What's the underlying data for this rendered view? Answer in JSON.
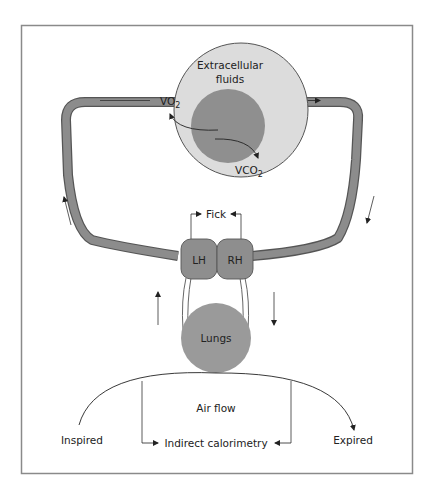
{
  "colors": {
    "frame": "#8a8a8a",
    "vessel_fill": "#8c8c8c",
    "vessel_edge": "#555555",
    "ecf_fill": "#dcdcdc",
    "cell_fill": "#8f8f8f",
    "heart_fill": "#8e8e8e",
    "lungs_fill": "#9a9a9a",
    "line": "#333333"
  },
  "labels": {
    "extracellular_line1": "Extracellular",
    "extracellular_line2": "fluids",
    "vo2_main": "VO",
    "vo2_sub": "2",
    "vco2_main": "VCO",
    "vco2_sub": "2",
    "fick": "Fick",
    "left_heart": "LH",
    "right_heart": "RH",
    "lungs": "Lungs",
    "air_flow": "Air flow",
    "inspired": "Inspired",
    "expired": "Expired",
    "indirect_calorimetry": "Indirect calorimetry"
  }
}
